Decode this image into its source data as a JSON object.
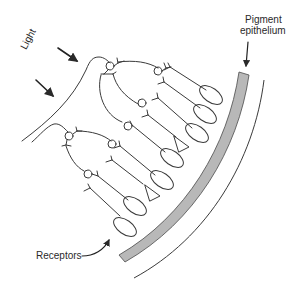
{
  "diagram": {
    "type": "retina-cross-section",
    "labels": {
      "light": "Light",
      "pigment_line1": "Pigment",
      "pigment_line2": "epithelium",
      "receptors": "Receptors"
    },
    "colors": {
      "stroke": "#3a3a3a",
      "pigment_fill": "#b8b8b8",
      "background": "#ffffff"
    },
    "elements": {
      "light_arrows": 2,
      "ganglion_cells": 7,
      "rod_receptors": 7,
      "cone_receptors": 2
    }
  }
}
